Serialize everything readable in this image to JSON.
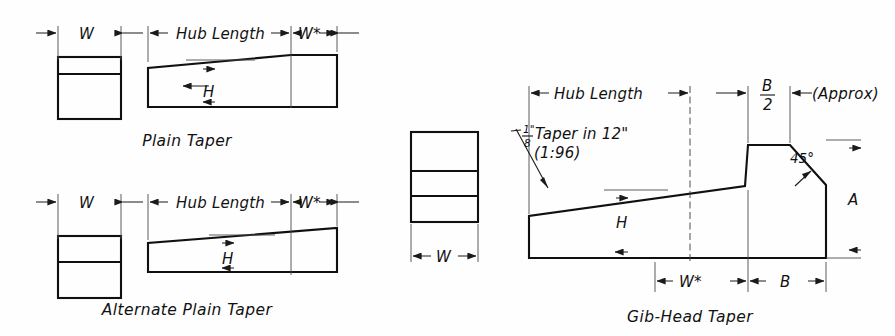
{
  "figure": {
    "background_color": "#fefefe",
    "line_color": "#101010"
  },
  "labels": {
    "w": "W",
    "w_star": "W*",
    "h": "H",
    "a": "A",
    "b": "B",
    "hub_length": "Hub Length",
    "approx": "(Approx)",
    "angle_45": "45°",
    "taper_text": "Taper in 12\"",
    "taper_ratio": "(1:96)",
    "taper_frac_num": "1\"",
    "taper_frac_den": "8",
    "b_over_2_num": "B",
    "b_over_2_den": "2"
  },
  "views": [
    {
      "id": "plain-taper",
      "caption": "Plain Taper",
      "section_bands": 2,
      "dimensions": [
        "W",
        "Hub Length",
        "W*",
        "H"
      ]
    },
    {
      "id": "alternate-plain-taper",
      "caption": "Alternate Plain Taper",
      "section_bands": 2,
      "dimensions": [
        "W",
        "Hub Length",
        "W*",
        "H"
      ]
    },
    {
      "id": "gib-head-taper",
      "caption": "Gib-Head Taper",
      "section_bands": 3,
      "dimensions": [
        "W",
        "Hub Length",
        "W*",
        "H",
        "A",
        "B",
        "B/2",
        "45°"
      ]
    }
  ],
  "captions": {
    "plain": "Plain Taper",
    "alternate": "Alternate Plain Taper",
    "gibhead": "Gib-Head Taper"
  }
}
